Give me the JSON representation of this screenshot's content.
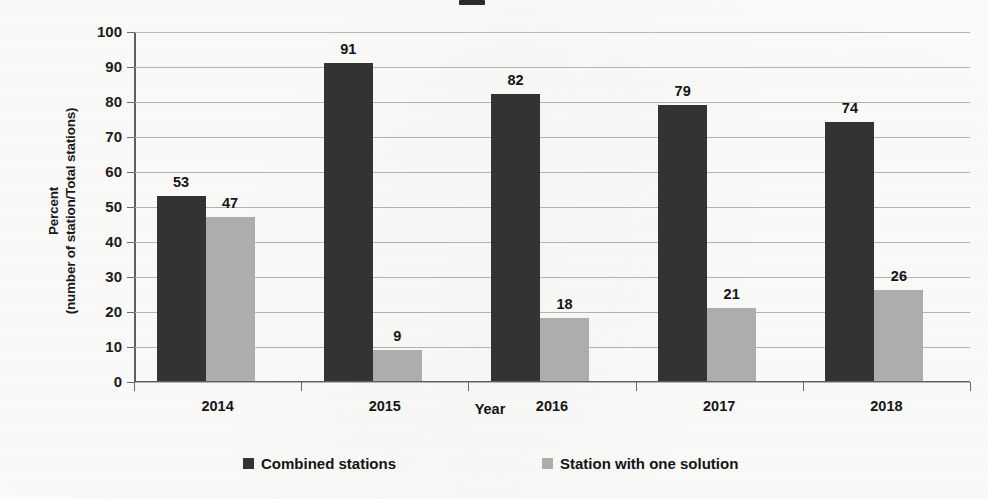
{
  "chart_data": {
    "type": "bar",
    "title": "",
    "categories": [
      "2014",
      "2015",
      "2016",
      "2017",
      "2018"
    ],
    "series": [
      {
        "name": "Combined stations",
        "color": "#333333",
        "values": [
          53,
          91,
          82,
          79,
          74
        ]
      },
      {
        "name": "Station with one solution",
        "color": "#adadad",
        "values": [
          47,
          9,
          18,
          21,
          26
        ]
      }
    ],
    "xlabel": "Year",
    "ylabel_line1": "Percent",
    "ylabel_line2": "(number of station/Total stations)",
    "ylim": [
      0,
      100
    ],
    "ytick_labels": [
      "100",
      "90",
      "80",
      "70",
      "60",
      "50",
      "40",
      "30",
      "20",
      "10",
      "0"
    ],
    "ytick_values": [
      100,
      90,
      80,
      70,
      60,
      50,
      40,
      30,
      20,
      10,
      0
    ],
    "grid": true,
    "legend_position": "bottom",
    "data_labels": {
      "2014": {
        "Combined stations": "53",
        "Station with one solution": "47"
      },
      "2015": {
        "Combined stations": "91",
        "Station with one solution": "9"
      },
      "2016": {
        "Combined stations": "82",
        "Station with one solution": "18"
      },
      "2017": {
        "Combined stations": "79",
        "Station with one solution": "21"
      },
      "2018": {
        "Combined stations": "74",
        "Station with one solution": "26"
      }
    }
  },
  "legend": {
    "items": [
      {
        "label": "Combined stations",
        "swatch": "dark"
      },
      {
        "label": "Station with one solution",
        "swatch": "light"
      }
    ]
  }
}
